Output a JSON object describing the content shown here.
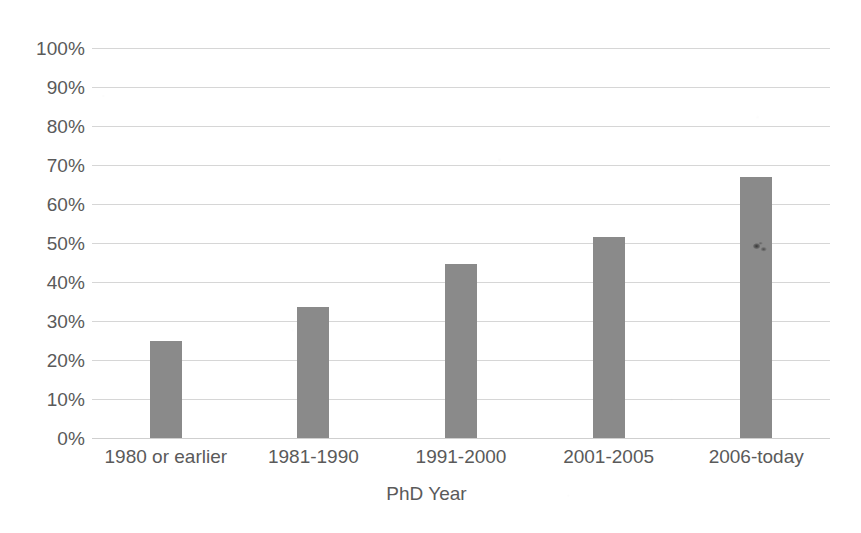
{
  "chart_data": {
    "type": "bar",
    "title": "",
    "subtitle": "",
    "xlabel": "PhD Year",
    "ylabel": "",
    "categories": [
      "1980 or earlier",
      "1981-1990",
      "1991-2000",
      "2001-2005",
      "2006-today"
    ],
    "values": [
      25,
      33.5,
      44.5,
      51.5,
      67
    ],
    "value_labels": [
      "25%",
      "33.5%",
      "44.5%",
      "51.5%",
      "67%"
    ],
    "ylim": [
      0,
      100
    ],
    "ytick_values": [
      0,
      10,
      20,
      30,
      40,
      50,
      60,
      70,
      80,
      90,
      100
    ],
    "ytick_labels": [
      "0%",
      "10%",
      "20%",
      "30%",
      "40%",
      "50%",
      "60%",
      "70%",
      "80%",
      "90%",
      "100%"
    ],
    "grid": true,
    "grid_axis": "y",
    "legend": false,
    "legend_position": "none",
    "series": [
      {
        "name": "",
        "values": [
          25,
          33.5,
          44.5,
          51.5,
          67
        ]
      }
    ],
    "colors": {
      "bar": "#8a8a8a",
      "gridline": "#d6d6d6",
      "baseline": "#cfcfcf",
      "text": "#5a5a5a",
      "background": "#ffffff"
    },
    "annotations": [
      {
        "name": "scan-smudge",
        "description": "small dark ink smudge artifact on the 2006-today bar",
        "near_category": "2006-today",
        "near_value": 49
      }
    ]
  }
}
